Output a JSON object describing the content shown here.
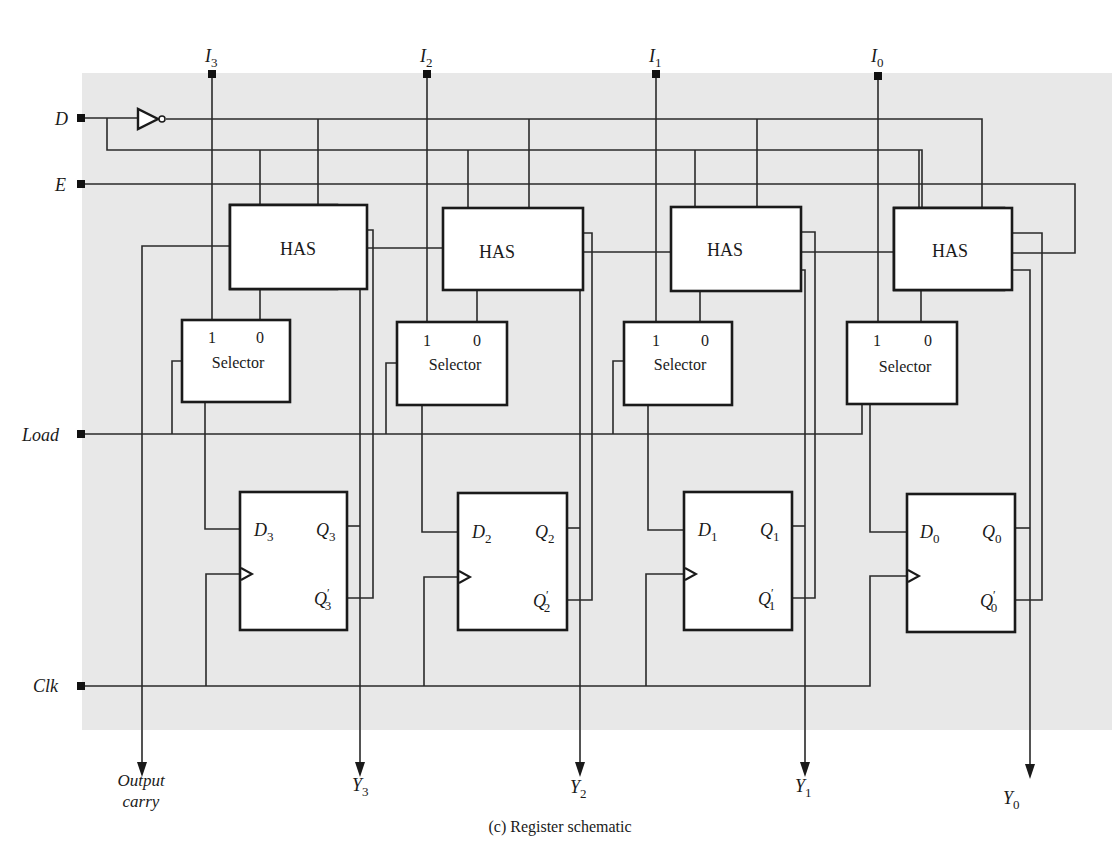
{
  "diagram": {
    "caption": "(c)  Register schematic",
    "background_panel_color": "#e8e8e8",
    "inputs_left": [
      {
        "name": "D",
        "label": "D"
      },
      {
        "name": "E",
        "label": "E"
      },
      {
        "name": "Load",
        "label": "Load"
      },
      {
        "name": "Clk",
        "label": "Clk"
      }
    ],
    "inputs_top": [
      {
        "label": "I",
        "sub": "3"
      },
      {
        "label": "I",
        "sub": "2"
      },
      {
        "label": "I",
        "sub": "1"
      },
      {
        "label": "I",
        "sub": "0"
      }
    ],
    "stages": [
      {
        "has_label": "HAS",
        "selector_label": "Selector",
        "sel_in1": "1",
        "sel_in0": "0",
        "ff_d": "D",
        "ff_q": "Q",
        "ff_qn": "Q",
        "sub": "3",
        "prime": "′",
        "output": "Y",
        "output_sub": "3"
      },
      {
        "has_label": "HAS",
        "selector_label": "Selector",
        "sel_in1": "1",
        "sel_in0": "0",
        "ff_d": "D",
        "ff_q": "Q",
        "ff_qn": "Q",
        "sub": "2",
        "prime": "′",
        "output": "Y",
        "output_sub": "2"
      },
      {
        "has_label": "HAS",
        "selector_label": "Selector",
        "sel_in1": "1",
        "sel_in0": "0",
        "ff_d": "D",
        "ff_q": "Q",
        "ff_qn": "Q",
        "sub": "1",
        "prime": "′",
        "output": "Y",
        "output_sub": "1"
      },
      {
        "has_label": "HAS",
        "selector_label": "Selector",
        "sel_in1": "1",
        "sel_in0": "0",
        "ff_d": "D",
        "ff_q": "Q",
        "ff_qn": "Q",
        "sub": "0",
        "prime": "′",
        "output": "Y",
        "output_sub": "0"
      }
    ],
    "output_carry": {
      "line1": "Output",
      "line2": "carry"
    }
  }
}
